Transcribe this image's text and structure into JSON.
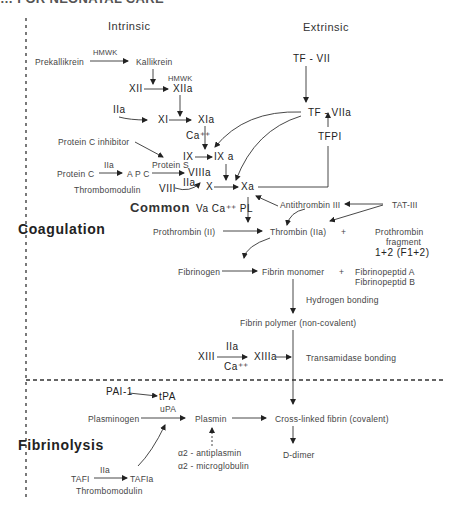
{
  "header": {
    "title_clipped": "… FOR NEONATAL CARE"
  },
  "columns": {
    "intrinsic": "Intrinsic",
    "extrinsic": "Extrinsic"
  },
  "sections": {
    "coagulation": "Coagulation",
    "common": "Common",
    "fibrinolysis": "Fibrinolysis"
  },
  "nodes": {
    "hmwk1": "HMWK",
    "prekallikrein": "Prekallikrein",
    "kallikrein": "Kallikrein",
    "hmwk2": "HMWK",
    "xii": "XII",
    "xiia": "XIIa",
    "iia1": "IIa",
    "xi": "XI",
    "xia": "XIa",
    "ca1": "Ca⁺⁺",
    "pci": "Protein C inhibitor",
    "ix": "IX",
    "ixa": "IX a",
    "iia2": "IIa",
    "proteins": "Protein S",
    "proteinc": "Protein C",
    "apc": "A P C",
    "viiia": "VIIIa",
    "thrombomodulin1": "Thrombomodulin",
    "viii": "VIII",
    "iia3": "IIa",
    "x": "X",
    "xa": "Xa",
    "tfvii": "TF - VII",
    "tfviia": "TF - VIIa",
    "tfpi": "TFPI",
    "va": "Va Ca⁺⁺ PL",
    "at3": "Antithrombin III",
    "tat3": "TAT-III",
    "prothrombin": "Prothrombin (II)",
    "thrombin": "Thrombin (IIa)",
    "plus1": "+",
    "pf1": "Prothrombin",
    "pf2": "fragment",
    "pf3": "1+2 (F1+2)",
    "fibrinogen": "Fibrinogen",
    "fibrinmono": "Fibrin monomer",
    "plus2": "+",
    "fpa": "Fibrinopeptid A",
    "fpb": "Fibrinopeptid B",
    "hbond": "Hydrogen bonding",
    "fpoly": "Fibrin polymer (non-covalent)",
    "xiii": "XIII",
    "iia4": "IIa",
    "xiiia": "XIIIa",
    "ca2": "Ca⁺⁺",
    "transam": "Transamidase bonding",
    "pai1": "PAI-1",
    "tpa": "tPA",
    "upa": "uPA",
    "plasminogen": "Plasminogen",
    "plasmin": "Plasmin",
    "crosslinked": "Cross-linked fibrin (covalent)",
    "a2ap": "α2 - antiplasmin",
    "a2mg": "α2 - microglobulin",
    "ddimer": "D-dimer",
    "iia5": "IIa",
    "tafi": "TAFI",
    "tafia": "TAFIa",
    "thrombomodulin2": "Thrombomodulin"
  }
}
